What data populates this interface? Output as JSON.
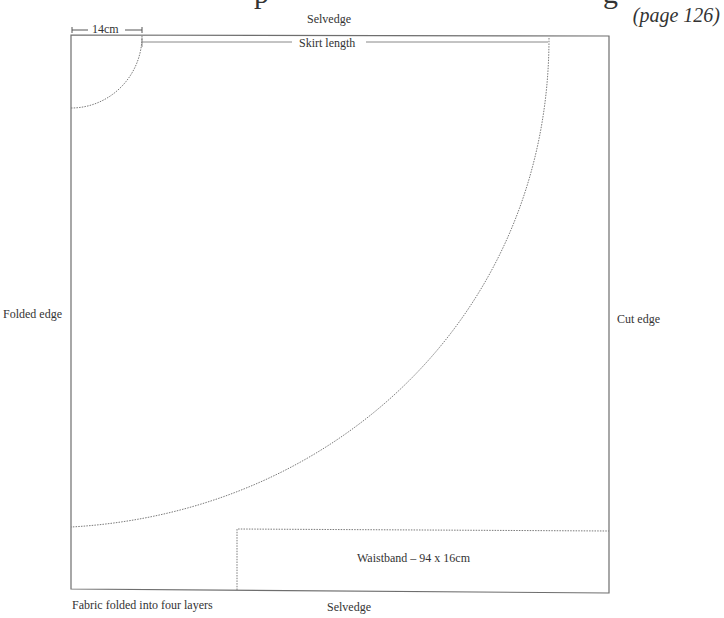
{
  "title": {
    "partial_visible": "p … g",
    "page_reference": "(page 126)"
  },
  "diagram": {
    "labels": {
      "selvedge_top": "Selvedge",
      "selvedge_bottom": "Selvedge",
      "folded_edge": "Folded edge",
      "cut_edge": "Cut edge",
      "waist_measure": "14cm",
      "skirt_length": "Skirt length",
      "waistband": "Waistband – 94 x 16cm",
      "fold_note": "Fabric folded into four layers"
    },
    "colors": {
      "line": "#6e6e6e",
      "dotted": "#7a7a7a",
      "text": "#333333",
      "background": "#ffffff"
    }
  }
}
